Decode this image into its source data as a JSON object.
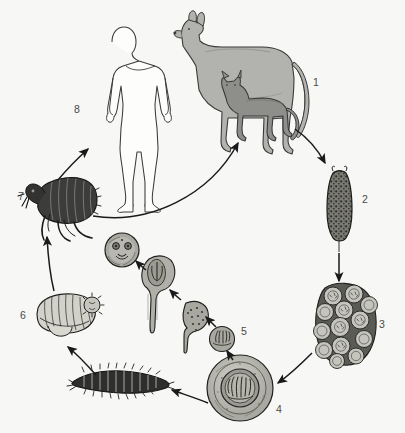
{
  "figure": {
    "background_color": "#f7f7f5",
    "width": 405,
    "height": 433,
    "line_color": "#1a1a1a",
    "label_color": "#4a4a4a"
  },
  "palette": {
    "dog_fill": "#b2b2ae",
    "cat_fill": "#8e8e8a",
    "human_fill": "#fdfdfb",
    "proglottid_fill": "#6e6e68",
    "egg_packet_fill": "#b8b8b2",
    "egg_fill": "#c2c2bb",
    "embryo_fill": "#9d9d96",
    "cysticercoid_fill": "#a8a8a1",
    "flea_fill": "#3c3c3a",
    "pupa_fill": "#cfcfc8",
    "larva_fill": "#2e2e2c",
    "outline": "#262624"
  },
  "stages": [
    {
      "number": "1",
      "name": "definitive-host-dog-and-cat",
      "label_x": 313,
      "label_y": 82,
      "description": "Dog and cat definitive hosts harbouring the adult tapeworm"
    },
    {
      "number": "2",
      "name": "gravid-proglottid",
      "label_x": 362,
      "label_y": 199,
      "description": "Gravid proglottid passed in faeces"
    },
    {
      "number": "3",
      "name": "egg-packet",
      "label_x": 379,
      "label_y": 324,
      "description": "Egg packet released from the proglottid"
    },
    {
      "number": "4",
      "name": "egg-with-oncosphere",
      "label_x": 276,
      "label_y": 409,
      "description": "Individual egg containing a hexacanth oncosphere"
    },
    {
      "number": "5",
      "name": "oncosphere-in-larva",
      "label_x": 241,
      "label_y": 331,
      "description": "Oncosphere hatching in the flea larva gut"
    },
    {
      "number": "6",
      "name": "flea-pupa",
      "label_x": 20,
      "label_y": 315,
      "description": "Flea pupa within cocoon"
    },
    {
      "number": "7",
      "name": "adult-flea",
      "label_x": 18,
      "label_y": 196,
      "description": "Adult flea carrying the infective cysticercoid"
    },
    {
      "number": "8",
      "name": "human-accidental-host",
      "label_x": 74,
      "label_y": 109,
      "description": "Human accidental host, usually a child"
    }
  ],
  "intermediate_stages": [
    {
      "name": "cysticercoid-mature",
      "description": "Mature cysticercoid with invaginated scolex"
    },
    {
      "name": "cysticercoid-developing",
      "description": "Developing cysticercoid with forming scolex"
    },
    {
      "name": "cysticercoid-early",
      "description": "Early cysticercoid with hooklets"
    },
    {
      "name": "flea-larva",
      "description": "Flea larva that ingests the egg"
    }
  ],
  "arrows": [
    {
      "name": "arrow-host-to-proglottid",
      "from": "1",
      "to": "2"
    },
    {
      "name": "arrow-proglottid-to-egg-packet",
      "from": "2",
      "to": "3"
    },
    {
      "name": "arrow-egg-packet-to-egg",
      "from": "3",
      "to": "4"
    },
    {
      "name": "arrow-egg-to-flea-larva",
      "from": "4",
      "to": "flea-larva"
    },
    {
      "name": "arrow-egg-to-oncosphere",
      "from": "4",
      "to": "5"
    },
    {
      "name": "arrow-oncosphere-to-early-cysticercoid",
      "from": "5",
      "to": "cysticercoid-early"
    },
    {
      "name": "arrow-early-to-developing-cysticercoid",
      "from": "cysticercoid-early",
      "to": "cysticercoid-developing"
    },
    {
      "name": "arrow-developing-to-mature-cysticercoid",
      "from": "cysticercoid-developing",
      "to": "cysticercoid-mature"
    },
    {
      "name": "arrow-flea-larva-to-pupa",
      "from": "flea-larva",
      "to": "6"
    },
    {
      "name": "arrow-pupa-to-adult-flea",
      "from": "6",
      "to": "7"
    },
    {
      "name": "arrow-flea-to-host",
      "from": "7",
      "to": "1"
    },
    {
      "name": "arrow-flea-to-human",
      "from": "7",
      "to": "8"
    }
  ]
}
